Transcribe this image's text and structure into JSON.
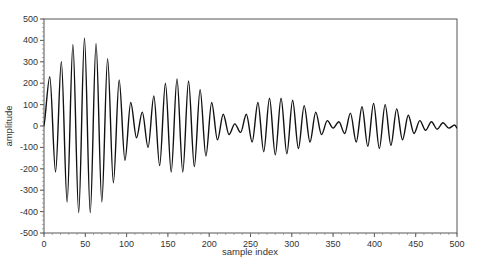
{
  "chart_data": {
    "type": "line",
    "title": "",
    "xlabel": "sample index",
    "ylabel": "amplitude",
    "xlim": [
      0,
      500
    ],
    "ylim": [
      -500,
      500
    ],
    "xticks": [
      0,
      50,
      100,
      150,
      200,
      250,
      300,
      350,
      400,
      450,
      500
    ],
    "yticks": [
      500,
      400,
      300,
      200,
      100,
      0,
      -100,
      -200,
      -300,
      -400,
      -500
    ],
    "grid": false,
    "legend": null,
    "series": [
      {
        "name": "signal",
        "color": "#111111",
        "x": [
          0,
          7,
          14,
          21,
          28,
          35,
          42,
          49,
          56,
          63,
          70,
          77,
          84,
          91,
          98,
          105,
          112,
          119,
          126,
          133,
          140,
          147,
          154,
          161,
          168,
          175,
          182,
          189,
          196,
          203,
          210,
          217,
          224,
          231,
          238,
          245,
          252,
          259,
          266,
          273,
          280,
          287,
          294,
          301,
          308,
          315,
          322,
          329,
          336,
          343,
          350,
          357,
          364,
          371,
          378,
          385,
          392,
          399,
          406,
          413,
          420,
          427,
          434,
          441,
          448,
          455,
          462,
          469,
          476,
          483,
          490,
          497,
          500
        ],
        "y": [
          0,
          230,
          -215,
          300,
          -355,
          380,
          -405,
          410,
          -405,
          385,
          -355,
          315,
          -265,
          215,
          -160,
          110,
          -55,
          65,
          -100,
          140,
          -185,
          200,
          -215,
          220,
          -215,
          210,
          -190,
          170,
          -140,
          110,
          -65,
          55,
          -40,
          10,
          -30,
          55,
          -75,
          110,
          -120,
          130,
          -135,
          130,
          -130,
          120,
          -105,
          95,
          -75,
          65,
          -40,
          25,
          -10,
          20,
          -35,
          60,
          -75,
          90,
          -95,
          105,
          -105,
          100,
          -90,
          80,
          -65,
          50,
          -35,
          25,
          -20,
          20,
          -15,
          15,
          -10,
          5,
          -10
        ]
      }
    ]
  },
  "labels": {
    "xlabel": "sample index",
    "ylabel": "amplitude"
  }
}
